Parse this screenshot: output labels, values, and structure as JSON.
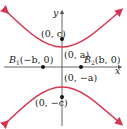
{
  "diagram": {
    "colors": {
      "curve": "#d9344f",
      "axis": "#555555",
      "point": "#111111",
      "text": "#222222"
    },
    "axes": {
      "x_label": "x",
      "y_label": "y"
    },
    "points": [
      {
        "id": "focus-top",
        "label": "(0, c)"
      },
      {
        "id": "vertex-top",
        "label": "(0, a)"
      },
      {
        "id": "b1",
        "label_main": "B",
        "label_sub": "1",
        "label_rest": "(−b, 0)"
      },
      {
        "id": "b2",
        "label_main": "B",
        "label_sub": "2",
        "label_rest": "(b, 0)"
      },
      {
        "id": "vertex-bottom",
        "label": "(0, −a)"
      },
      {
        "id": "focus-bottom",
        "label": "(0, −c)"
      }
    ]
  }
}
